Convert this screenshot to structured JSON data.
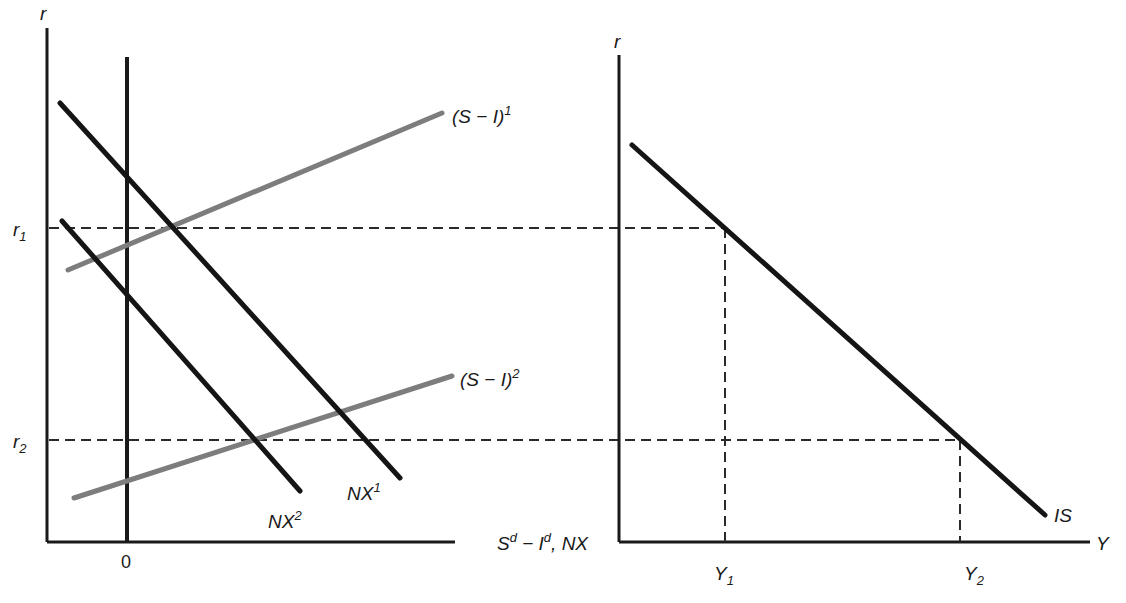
{
  "left_panel": {
    "y_axis_label": "r",
    "x_axis_label": {
      "base": "S",
      "sup1": "d",
      "mid": " − I",
      "sup2": "d",
      "tail": ", NX"
    },
    "zero_tick": "0",
    "rate_labels": {
      "r1": {
        "base": "r",
        "sub": "1"
      },
      "r2": {
        "base": "r",
        "sub": "2"
      }
    },
    "curves": {
      "si1": {
        "base": "(S − I)",
        "sup": "1"
      },
      "si2": {
        "base": "(S − I)",
        "sup": "2"
      },
      "nx1": {
        "base": "NX",
        "sup": "1"
      },
      "nx2": {
        "base": "NX",
        "sup": "2"
      }
    }
  },
  "right_panel": {
    "y_axis_label": "r",
    "x_axis_label": "Y",
    "curve_label": "IS",
    "output_labels": {
      "y1": {
        "base": "Y",
        "sub": "1"
      },
      "y2": {
        "base": "Y",
        "sub": "2"
      }
    }
  },
  "colors": {
    "black_lines": "#151515",
    "gray_lines": "#7d7d7d",
    "background": "#ffffff"
  }
}
